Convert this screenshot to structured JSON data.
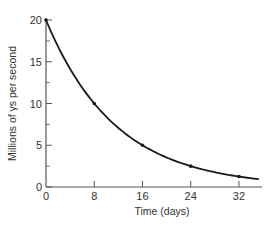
{
  "chart_data": {
    "type": "line",
    "title": "",
    "xlabel": "Time (days)",
    "ylabel": "Millions of γs per second",
    "xlim": [
      0,
      36
    ],
    "ylim": [
      0,
      20
    ],
    "x_ticks": [
      0,
      8,
      16,
      24,
      32
    ],
    "x_tick_labels": [
      "0",
      "8",
      "16",
      "24",
      "32"
    ],
    "y_ticks": [
      0,
      5,
      10,
      15,
      20
    ],
    "y_tick_labels": [
      "0",
      "5",
      "10",
      "15",
      "20"
    ],
    "y_minor_ticks": [
      2.5,
      7.5,
      12.5,
      17.5
    ],
    "grid": false,
    "legend": null,
    "series": [
      {
        "name": "Gamma emission rate",
        "marked_points": {
          "x": [
            0,
            8,
            16,
            24,
            32
          ],
          "y": [
            20,
            10,
            5,
            2.5,
            1.25
          ]
        },
        "curve": {
          "form": "exponential decay",
          "initial_value": 20,
          "half_life_days": 8,
          "x_start": 0,
          "x_end": 35.3
        },
        "color": "#1a1a1a"
      }
    ]
  },
  "colors": {
    "axis": "#555555",
    "curve": "#1a1a1a",
    "text": "#333333",
    "background": "#ffffff"
  }
}
